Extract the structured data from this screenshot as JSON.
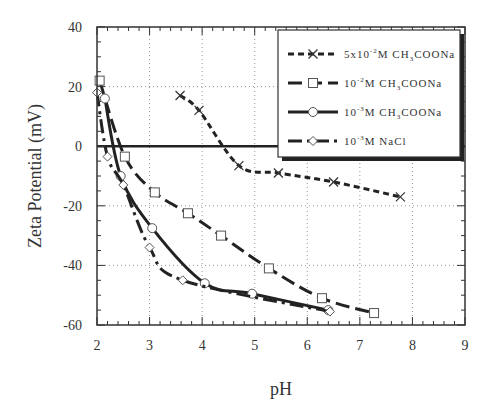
{
  "chart_data": {
    "type": "line",
    "title": "",
    "xlabel": "pH",
    "ylabel": "Zeta Potential (mV)",
    "xlim": [
      2,
      9
    ],
    "ylim": [
      -60,
      40
    ],
    "xticks": [
      2,
      3,
      4,
      5,
      6,
      7,
      8,
      9
    ],
    "yticks": [
      -60,
      -40,
      -20,
      0,
      20,
      40
    ],
    "xtick_labels": [
      "2",
      "3",
      "4",
      "5",
      "6",
      "7",
      "8",
      "9"
    ],
    "ytick_labels": [
      "-60",
      "-40",
      "-20",
      "0",
      "20",
      "40"
    ],
    "grid": true,
    "zero_line": true,
    "legend_position": "top-right",
    "series": [
      {
        "name": "5x10-2M CH3COONa",
        "label_parts": {
          "pre": "5x10",
          "exp": "-2",
          "mid": "M CH",
          "sub": "3",
          "post": "COONa"
        },
        "marker": "x",
        "dash": "dash",
        "x": [
          3.58,
          3.94,
          4.7,
          5.45,
          6.5,
          7.77
        ],
        "y": [
          17,
          12,
          -6.5,
          -9,
          -12,
          -17
        ]
      },
      {
        "name": "10-2M CH3COONa",
        "label_parts": {
          "pre": "10",
          "exp": "-2",
          "mid": "M CH",
          "sub": "3",
          "post": "COONa"
        },
        "marker": "square",
        "dash": "longdash",
        "x": [
          2.05,
          2.53,
          3.1,
          3.73,
          4.36,
          5.27,
          6.28,
          7.27
        ],
        "y": [
          22,
          -3.5,
          -15.5,
          -22.5,
          -30,
          -41,
          -51,
          -56
        ]
      },
      {
        "name": "10-3M CH3COONa",
        "label_parts": {
          "pre": "10",
          "exp": "-3",
          "mid": "M CH",
          "sub": "3",
          "post": "COONa"
        },
        "marker": "circle",
        "dash": "solid",
        "x": [
          2.15,
          2.45,
          3.05,
          4.05,
          4.95,
          6.4
        ],
        "y": [
          16,
          -10,
          -27.5,
          -46,
          -49.5,
          -55
        ]
      },
      {
        "name": "10-3M NaCl",
        "label_parts": {
          "pre": "10",
          "exp": "-3",
          "mid": "M NaCl",
          "sub": "",
          "post": ""
        },
        "marker": "diamond",
        "dash": "dashdot",
        "x": [
          2.0,
          2.2,
          2.5,
          3.0,
          3.63,
          6.43
        ],
        "y": [
          18,
          -3.5,
          -13,
          -34,
          -45,
          -55.5
        ]
      }
    ]
  }
}
